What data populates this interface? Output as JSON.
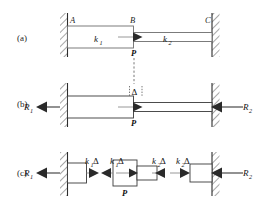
{
  "figure": {
    "background_color": "#ffffff",
    "ink_color": "#1f1f1f",
    "accent_gray": "#6e6e6e"
  },
  "panels": [
    {
      "id": "a",
      "label": "(a)",
      "description": "Bar AC fixed at both walls, load P applied at B",
      "node_labels": [
        "A",
        "B",
        "C"
      ],
      "stiffness_left": "k",
      "stiffness_left_sub": "1",
      "stiffness_right": "k",
      "stiffness_right_sub": "2",
      "load_label": "P"
    },
    {
      "id": "b",
      "label": "(b)",
      "description": "Free-body diagram of whole bar with wall reactions and deflection",
      "reaction_left": "R",
      "reaction_left_sub": "1",
      "reaction_right": "R",
      "reaction_right_sub": "2",
      "deflection_label": "Δ",
      "load_label": "P"
    },
    {
      "id": "c",
      "label": "(c)",
      "description": "Separated free-body diagrams of the two springs and the joint",
      "reaction_left": "R",
      "reaction_left_sub": "1",
      "reaction_right": "R",
      "reaction_right_sub": "2",
      "spring_force_left_1": "k",
      "spring_force_left_1_sub": "1",
      "spring_force_left_1_tail": "Δ",
      "spring_force_left_2": "k",
      "spring_force_left_2_sub": "1",
      "spring_force_left_2_tail": "Δ",
      "spring_force_right_1": "k",
      "spring_force_right_1_sub": "2",
      "spring_force_right_1_tail": "Δ",
      "spring_force_right_2": "k",
      "spring_force_right_2_sub": "2",
      "spring_force_right_2_tail": "Δ",
      "load_label": "P"
    }
  ],
  "icons": {
    "arrow": "arrow-head",
    "hatching": "wall-hatch",
    "dashed": "dashed-leader"
  }
}
